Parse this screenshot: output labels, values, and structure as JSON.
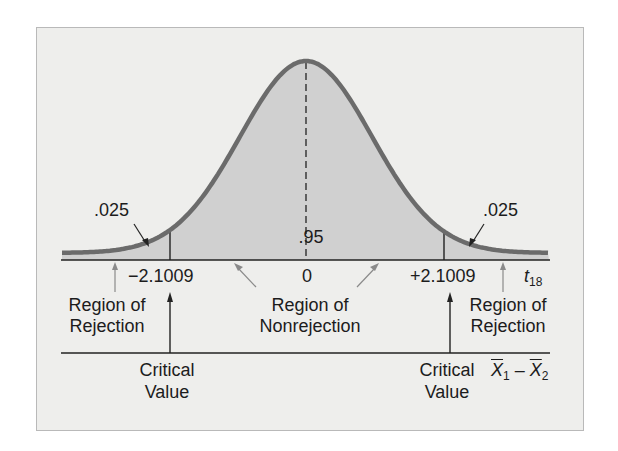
{
  "figure": {
    "probability_labels": {
      "left_tail": ".025",
      "center": ".95",
      "right_tail": ".025"
    },
    "axis_ticks": {
      "left_critical": "−2.1009",
      "center": "0",
      "right_critical": "+2.1009"
    },
    "axis_name": {
      "base": "t",
      "subscript": "18"
    },
    "region_labels": {
      "left_rejection_line1": "Region of",
      "left_rejection_line2": "Rejection",
      "nonrejection_line1": "Region of",
      "nonrejection_line2": "Nonrejection",
      "right_rejection_line1": "Region of",
      "right_rejection_line2": "Rejection"
    },
    "critical_labels": {
      "left_line1": "Critical",
      "left_line2": "Value",
      "right_line1": "Critical",
      "right_line2": "Value"
    },
    "second_axis_name": {
      "x1": "X",
      "sub1": "1",
      "minus": "–",
      "x2": "X",
      "sub2": "2"
    },
    "colors": {
      "curve": "#6b6b6b",
      "fill": "#d0d0d0",
      "background": "#eeeeec",
      "axis": "#222222",
      "gray_arrow": "#8a8a8a"
    }
  },
  "chart_data": {
    "type": "area",
    "title": "",
    "distribution": "Student t, 18 degrees of freedom",
    "xlabel": "t18 / X1bar - X2bar",
    "critical_values": [
      -2.1009,
      2.1009
    ],
    "areas": {
      "left_tail": 0.025,
      "center": 0.95,
      "right_tail": 0.025
    },
    "x_ticks": [
      "-2.1009",
      "0",
      "+2.1009"
    ],
    "regions": [
      "Region of Rejection",
      "Region of Nonrejection",
      "Region of Rejection"
    ]
  }
}
